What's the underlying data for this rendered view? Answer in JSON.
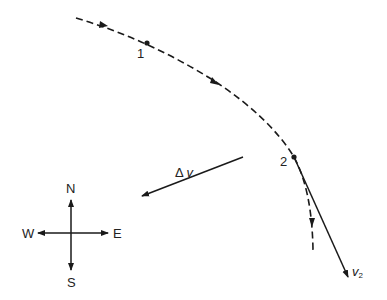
{
  "diagram": {
    "type": "orbital velocity change",
    "colors": {
      "line": "#1a1a1a",
      "background": "#ffffff"
    },
    "trajectory": {
      "style": "dashed",
      "points": [
        {
          "id": "point-1",
          "label": "1"
        },
        {
          "id": "point-2",
          "label": "2"
        }
      ]
    },
    "vectors": {
      "delta_v": {
        "symbol": "Δ",
        "var": "v"
      },
      "v2": {
        "var": "v",
        "sub": "2"
      }
    },
    "compass": {
      "north": "N",
      "south": "S",
      "east": "E",
      "west": "W"
    }
  }
}
